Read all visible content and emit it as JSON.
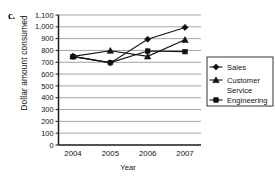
{
  "panel": {
    "letter": "c."
  },
  "chart_data": {
    "type": "line",
    "title": "",
    "xlabel": "Year",
    "ylabel": "Dollar amount consumed",
    "categories": [
      "2004",
      "2005",
      "2006",
      "2007"
    ],
    "x": [
      2004,
      2005,
      2006,
      2007
    ],
    "ylim": [
      0,
      1100
    ],
    "ytick_step": 100,
    "yticks": [
      0,
      100,
      200,
      300,
      400,
      500,
      600,
      700,
      800,
      900,
      1000,
      1100
    ],
    "ytick_labels": [
      "0",
      "100",
      "200",
      "300",
      "400",
      "500",
      "600",
      "700",
      "800",
      "900",
      "1,000",
      "1,100"
    ],
    "grid": true,
    "grid_axis": "y",
    "legend_position": "right",
    "series": [
      {
        "name": "Sales",
        "marker": "diamond",
        "values": [
          750,
          695,
          895,
          995
        ]
      },
      {
        "name": "Customer Service",
        "marker": "triangle",
        "values": [
          750,
          798,
          750,
          890
        ]
      },
      {
        "name": "Engineering",
        "marker": "square",
        "values": [
          748,
          697,
          795,
          790
        ]
      }
    ]
  },
  "legend": {
    "entries": [
      {
        "label": "Sales",
        "marker": "diamond"
      },
      {
        "label": "Customer",
        "label2": "Service",
        "marker": "triangle"
      },
      {
        "label": "Engineering",
        "marker": "square"
      }
    ]
  },
  "colors": {
    "ink": "#111111",
    "grid": "#8e8e8e",
    "axis": "#1a1a1a",
    "background": "#ffffff"
  }
}
